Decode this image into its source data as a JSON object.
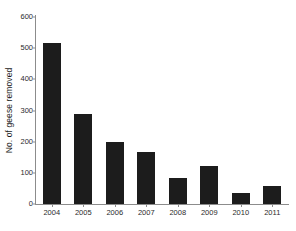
{
  "chart_data": {
    "type": "bar",
    "title": "",
    "subtitle": "",
    "xlabel": "",
    "ylabel": "No. of geese removed",
    "categories": [
      "2004",
      "2005",
      "2006",
      "2007",
      "2008",
      "2009",
      "2010",
      "2011"
    ],
    "values": [
      517,
      290,
      199,
      167,
      83,
      122,
      35,
      58
    ],
    "ylim": [
      0,
      600
    ],
    "yticks": [
      0,
      100,
      200,
      300,
      400,
      500,
      600
    ],
    "ytick_labels": [
      "0",
      "100",
      "200",
      "300",
      "400",
      "500",
      "600"
    ],
    "grid": false,
    "legend": null,
    "legend_position": "none",
    "bar_color": "#1c1c1c",
    "axis_color": "#8c8c8c",
    "text_color": "#2b2b2b",
    "background_color": "#ffffff",
    "annotations": []
  }
}
